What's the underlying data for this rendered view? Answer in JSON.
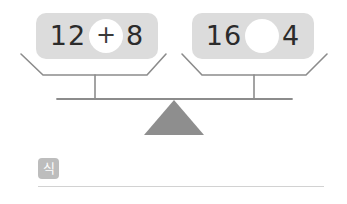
{
  "canvas": {
    "width": 347,
    "height": 204,
    "background": "#ffffff"
  },
  "colors": {
    "card_background": "#dcdcdc",
    "scale_stroke": "#8c8c8c",
    "fulcrum_fill": "#8e8e8e",
    "number_text": "#2b2b2b",
    "operator_circle_fill": "#ffffff",
    "label_chip_background": "#bdbdbd",
    "answer_line": "#d2d2d2"
  },
  "problem": {
    "type": "balance-scale-equation",
    "left_expression": {
      "first_number": "12",
      "operator": "+",
      "second_number": "8",
      "operator_filled": true
    },
    "right_expression": {
      "first_number": "16",
      "operator": "",
      "second_number": "4",
      "operator_filled": false
    }
  },
  "scale": {
    "fulcrum_icon": "triangle-fulcrum-icon",
    "left_pan_icon": "balance-pan-icon",
    "right_pan_icon": "balance-pan-icon",
    "beam_icon": "balance-beam-icon",
    "balanced": true
  },
  "answer": {
    "label": "식",
    "value": "",
    "placeholder": ""
  }
}
